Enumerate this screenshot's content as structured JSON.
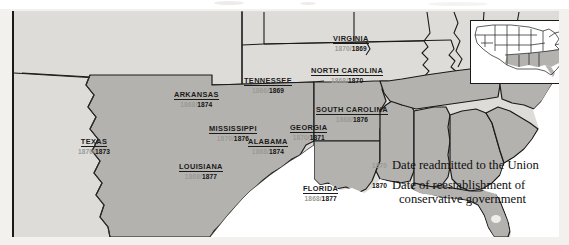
{
  "map": {
    "title": "",
    "colors": {
      "land_unshaded": "#dedcd8",
      "land_shaded": "#b4b2ae",
      "water": "#ffffff",
      "border": "#1a1a1a",
      "date_readmitted": "#9a9a97",
      "date_conservative": "#141414"
    },
    "states": [
      {
        "name": "TEXAS",
        "readmitted": "1870",
        "conservative": "1873",
        "x": 78,
        "y": 131
      },
      {
        "name": "ARKANSAS",
        "readmitted": "1868",
        "conservative": "1874",
        "x": 177,
        "y": 84
      },
      {
        "name": "LOUISIANA",
        "readmitted": "1868",
        "conservative": "1877",
        "x": 180,
        "y": 156
      },
      {
        "name": "MISSISSIPPI",
        "readmitted": "1870",
        "conservative": "1876",
        "x": 212,
        "y": 118
      },
      {
        "name": "ALABAMA",
        "readmitted": "1868",
        "conservative": "1874",
        "x": 249,
        "y": 131
      },
      {
        "name": "TENNESSEE",
        "readmitted": "1866",
        "conservative": "1869",
        "x": 248,
        "y": 70
      },
      {
        "name": "NORTH CAROLINA",
        "readmitted": "1868",
        "conservative": "1870",
        "x": 316,
        "y": 60
      },
      {
        "name": "SOUTH CAROLINA",
        "readmitted": "1868",
        "conservative": "1876",
        "x": 320,
        "y": 99
      },
      {
        "name": "GEORGIA",
        "readmitted": "1870",
        "conservative": "1871",
        "x": 292,
        "y": 117
      },
      {
        "name": "VIRGINIA",
        "readmitted": "1870",
        "conservative": "1869",
        "x": 334,
        "y": 28
      },
      {
        "name": "FLORIDA",
        "readmitted": "1868",
        "conservative": "1877",
        "x": 306,
        "y": 178
      }
    ],
    "separator": "/"
  },
  "legend": {
    "items": [
      {
        "year": "1870",
        "label": "Date readmitted to the Union",
        "label2": ""
      },
      {
        "year": "1870",
        "label": "Date of reestablishment of",
        "label2": "conservative government"
      }
    ]
  },
  "inset": {
    "name": "united-states-locator-map"
  }
}
